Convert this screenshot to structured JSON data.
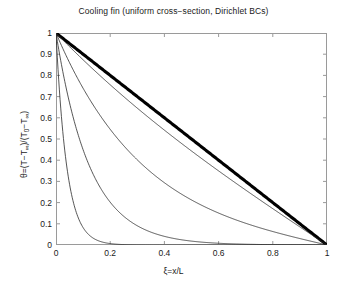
{
  "chart_data": {
    "type": "line",
    "title": "Cooling fin (uniform cross−section, Dirichlet BCs)",
    "xlabel": "ξ=x/L",
    "ylabel_parts": {
      "theta": "θ=(T−T",
      "inf1": "∞",
      "mid": ")/(T",
      "zero": "0",
      "tail": "−T",
      "inf2": "∞",
      "close": ")"
    },
    "ylabel_plain": "θ=(T−T∞)/(T0−T∞)",
    "xlim": [
      0,
      1
    ],
    "ylim": [
      0,
      1
    ],
    "grid": false,
    "legend": "none",
    "box": true,
    "xticks": [
      0,
      0.2,
      0.4,
      0.6,
      0.8,
      1
    ],
    "xtick_labels": [
      "0",
      "0.2",
      "0.4",
      "0.6",
      "0.8",
      "1"
    ],
    "yticks": [
      0,
      0.1,
      0.2,
      0.3,
      0.4,
      0.5,
      0.6,
      0.7,
      0.8,
      0.9,
      1
    ],
    "ytick_labels": [
      "0",
      "0.1",
      "0.2",
      "0.3",
      "0.4",
      "0.5",
      "0.6",
      "0.7",
      "0.8",
      "0.9",
      "1"
    ],
    "x": [
      0,
      0.025,
      0.05,
      0.075,
      0.1,
      0.125,
      0.15,
      0.175,
      0.2,
      0.25,
      0.3,
      0.35,
      0.4,
      0.45,
      0.5,
      0.55,
      0.6,
      0.65,
      0.7,
      0.75,
      0.8,
      0.85,
      0.9,
      0.95,
      1
    ],
    "series": [
      {
        "name": "m=0 (linear)",
        "m": 0,
        "color": "#000000",
        "width": 3.1,
        "values": [
          1,
          0.975,
          0.95,
          0.925,
          0.9,
          0.875,
          0.85,
          0.825,
          0.8,
          0.75,
          0.7,
          0.65,
          0.6,
          0.55,
          0.5,
          0.45,
          0.4,
          0.35,
          0.3,
          0.25,
          0.2,
          0.15,
          0.1,
          0.05,
          0
        ]
      },
      {
        "name": "m=1",
        "m": 1,
        "color": "#2b2b2b",
        "width": 0.8,
        "values": [
          1,
          0.9753,
          0.9506,
          0.9259,
          0.9012,
          0.8765,
          0.8518,
          0.8271,
          0.8024,
          0.7529,
          0.7034,
          0.6536,
          0.6036,
          0.5532,
          0.5024,
          0.4512,
          0.3994,
          0.3471,
          0.2942,
          0.2406,
          0.1863,
          0.1313,
          0.0755,
          0.0189,
          0
        ]
      },
      {
        "name": "m=3",
        "m": 3,
        "color": "#2b2b2b",
        "width": 0.8,
        "values": [
          1,
          0.9266,
          0.8543,
          0.7836,
          0.7148,
          0.6483,
          0.5843,
          0.5231,
          0.4649,
          0.3583,
          0.2649,
          0.1849,
          0.1177,
          0.0623,
          0.0174,
          0.0,
          0.0,
          0.0,
          0.0,
          0.0,
          0.0,
          0.0,
          0.0,
          0.0,
          0
        ]
      },
      {
        "name": "m=8",
        "m": 8,
        "color": "#2b2b2b",
        "width": 0.8,
        "values": [
          1,
          0.8187,
          0.6703,
          0.5488,
          0.4493,
          0.3679,
          0.3012,
          0.2466,
          0.2019,
          0.1353,
          0.0907,
          0.0608,
          0.0408,
          0.0273,
          0.0183,
          0.0122,
          0.0082,
          0.0055,
          0.0037,
          0.0024,
          0.0016,
          0.0011,
          0.0007,
          0.0004,
          0
        ]
      },
      {
        "name": "m=25",
        "m": 25,
        "color": "#2b2b2b",
        "width": 0.8,
        "values": [
          1,
          0.5353,
          0.2865,
          0.1534,
          0.0821,
          0.0439,
          0.0235,
          0.0126,
          0.0067,
          0.0019,
          0.0006,
          0.0002,
          0.0001,
          0.0,
          0.0,
          0.0,
          0.0,
          0.0,
          0.0,
          0.0,
          0.0,
          0.0,
          0.0,
          0.0,
          0
        ]
      }
    ]
  }
}
